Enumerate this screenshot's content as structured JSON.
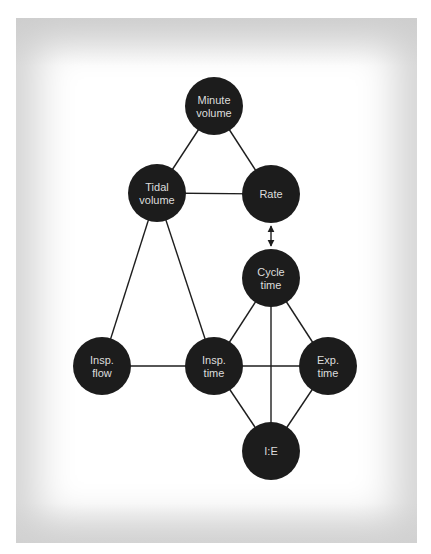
{
  "diagram": {
    "title": "",
    "colors": {
      "node_fill": "#1c1c1c",
      "node_text": "#dcdcdc",
      "edge": "#1e1e1e",
      "frame": "#d4d4d4",
      "background": "#ffffff"
    },
    "nodes": [
      {
        "id": "minute_volume",
        "lines": [
          "Minute",
          "volume"
        ],
        "cx": 214,
        "cy": 106,
        "r": 29
      },
      {
        "id": "tidal_volume",
        "lines": [
          "Tidal",
          "volume"
        ],
        "cx": 157,
        "cy": 193,
        "r": 29
      },
      {
        "id": "rate",
        "lines": [
          "Rate"
        ],
        "cx": 271,
        "cy": 194,
        "r": 29
      },
      {
        "id": "cycle_time",
        "lines": [
          "Cycle",
          "time"
        ],
        "cx": 271,
        "cy": 278,
        "r": 29
      },
      {
        "id": "insp_flow",
        "lines": [
          "Insp.",
          "flow"
        ],
        "cx": 102,
        "cy": 366,
        "r": 29
      },
      {
        "id": "insp_time",
        "lines": [
          "Insp.",
          "time"
        ],
        "cx": 214,
        "cy": 366,
        "r": 29
      },
      {
        "id": "exp_time",
        "lines": [
          "Exp.",
          "time"
        ],
        "cx": 328,
        "cy": 366,
        "r": 29
      },
      {
        "id": "ie",
        "lines": [
          "I:E"
        ],
        "cx": 271,
        "cy": 451,
        "r": 29
      }
    ],
    "edges": [
      {
        "from": "minute_volume",
        "to": "tidal_volume",
        "type": "line"
      },
      {
        "from": "minute_volume",
        "to": "rate",
        "type": "line"
      },
      {
        "from": "tidal_volume",
        "to": "rate",
        "type": "line"
      },
      {
        "from": "tidal_volume",
        "to": "insp_flow",
        "type": "line"
      },
      {
        "from": "tidal_volume",
        "to": "insp_time",
        "type": "line"
      },
      {
        "from": "rate",
        "to": "cycle_time",
        "type": "double-arrow"
      },
      {
        "from": "cycle_time",
        "to": "insp_time",
        "type": "line"
      },
      {
        "from": "cycle_time",
        "to": "exp_time",
        "type": "line"
      },
      {
        "from": "cycle_time",
        "to": "ie",
        "type": "line"
      },
      {
        "from": "insp_flow",
        "to": "insp_time",
        "type": "line"
      },
      {
        "from": "insp_time",
        "to": "exp_time",
        "type": "line"
      },
      {
        "from": "insp_time",
        "to": "ie",
        "type": "line"
      },
      {
        "from": "exp_time",
        "to": "ie",
        "type": "line"
      }
    ]
  }
}
